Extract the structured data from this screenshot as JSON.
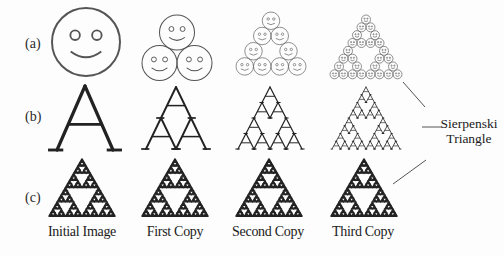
{
  "figure": {
    "row_labels": [
      "(a)",
      "(b)",
      "(c)"
    ],
    "columns": [
      {
        "caption": "Initial Image",
        "iteration": 0
      },
      {
        "caption": "First Copy",
        "iteration": 1
      },
      {
        "caption": "Second Copy",
        "iteration": 2
      },
      {
        "caption": "Third Copy",
        "iteration": 3
      }
    ],
    "rows": [
      {
        "label": "(a)",
        "motif": "smiley-face"
      },
      {
        "label": "(b)",
        "motif": "letter-A"
      },
      {
        "label": "(c)",
        "motif": "sierpinski-triangle"
      }
    ],
    "annotation": {
      "line1": "Sierpenski",
      "line2": "Triangle"
    },
    "colors": {
      "stroke": "#222222",
      "smiley_stroke": "#555555",
      "background": "#fdfdfd"
    }
  }
}
